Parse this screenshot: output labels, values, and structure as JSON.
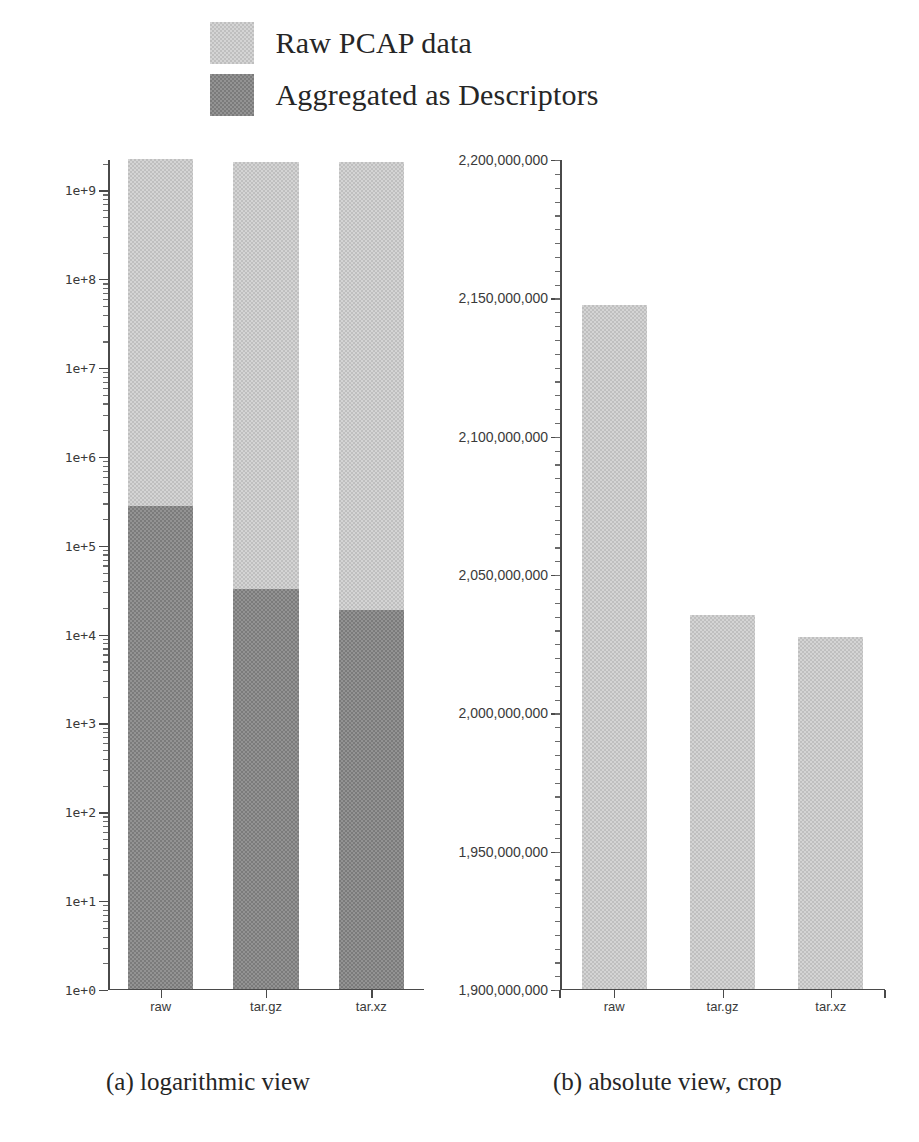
{
  "legend": {
    "items": [
      {
        "label": "Raw PCAP data",
        "swatch": "light-gray-dither",
        "color": "#d4d4d4"
      },
      {
        "label": "Aggregated as Descriptors",
        "swatch": "dark-gray-dither",
        "color": "#939393"
      }
    ]
  },
  "captions": {
    "a": "(a) logarithmic view",
    "b": "(b) absolute view, crop"
  },
  "chart_data": [
    {
      "id": "logarithmic-view",
      "type": "bar",
      "title": "(a) logarithmic view",
      "stacked": true,
      "yscale": "log",
      "xlabel": "",
      "ylabel": "",
      "ylim": [
        1,
        2200000000
      ],
      "grid": false,
      "legend_position": "above-figure",
      "categories": [
        "raw",
        "tar.gz",
        "tar.xz"
      ],
      "ytick_labels": [
        "1e+0",
        "1e+1",
        "1e+2",
        "1e+3",
        "1e+4",
        "1e+5",
        "1e+6",
        "1e+7",
        "1e+8",
        "1e+9"
      ],
      "ytick_values": [
        1,
        10,
        100,
        1000,
        10000,
        100000,
        1000000,
        10000000,
        100000000,
        1000000000
      ],
      "series": [
        {
          "name": "Raw PCAP data",
          "values": [
            2147000000,
            2035000000,
            2027000000
          ],
          "color": "#d4d4d4"
        },
        {
          "name": "Aggregated as Descriptors",
          "values": [
            270000,
            31000,
            18000
          ],
          "color": "#939393"
        }
      ]
    },
    {
      "id": "absolute-view-crop",
      "type": "bar",
      "title": "(b) absolute view, crop",
      "stacked": false,
      "yscale": "linear",
      "xlabel": "",
      "ylabel": "",
      "ylim": [
        1900000000,
        2200000000
      ],
      "grid": false,
      "legend_position": "above-figure",
      "categories": [
        "raw",
        "tar.gz",
        "tar.xz"
      ],
      "ytick_labels": [
        "1,900,000,000",
        "1,950,000,000",
        "2,000,000,000",
        "2,050,000,000",
        "2,100,000,000",
        "2,150,000,000",
        "2,200,000,000"
      ],
      "ytick_values": [
        1900000000,
        1950000000,
        2000000000,
        2050000000,
        2100000000,
        2150000000,
        2200000000
      ],
      "series": [
        {
          "name": "Raw PCAP data",
          "values": [
            2147000000,
            2035000000,
            2027000000
          ],
          "color": "#d4d4d4"
        }
      ]
    }
  ]
}
